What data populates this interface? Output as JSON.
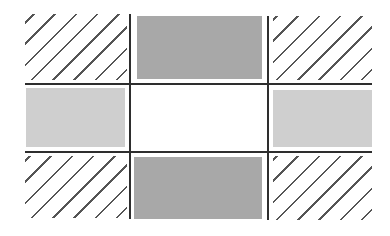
{
  "diagram": {
    "type": "3x3 grid tiling diagram",
    "colors": {
      "background": "#ffffff",
      "edge_rect": "#a8a8a8",
      "side_rect": "#cfcfcf",
      "grid_line": "#2e2e2e",
      "hatch": "#555555"
    },
    "cells": [
      {
        "row": 0,
        "col": 0,
        "fill": "hatched",
        "x": 25,
        "y": 14,
        "w": 102,
        "h": 66
      },
      {
        "row": 0,
        "col": 1,
        "fill": "dark-gray",
        "x": 137,
        "y": 16,
        "w": 125,
        "h": 63
      },
      {
        "row": 0,
        "col": 2,
        "fill": "hatched",
        "x": 273,
        "y": 16,
        "w": 99,
        "h": 64
      },
      {
        "row": 1,
        "col": 0,
        "fill": "light-gray",
        "x": 26,
        "y": 88,
        "w": 99,
        "h": 59
      },
      {
        "row": 1,
        "col": 1,
        "fill": "white",
        "x": 133,
        "y": 87,
        "w": 133,
        "h": 63
      },
      {
        "row": 1,
        "col": 2,
        "fill": "light-gray",
        "x": 273,
        "y": 90,
        "w": 99,
        "h": 57
      },
      {
        "row": 2,
        "col": 0,
        "fill": "hatched",
        "x": 25,
        "y": 156,
        "w": 102,
        "h": 62
      },
      {
        "row": 2,
        "col": 1,
        "fill": "dark-gray",
        "x": 134,
        "y": 157,
        "w": 128,
        "h": 62
      },
      {
        "row": 2,
        "col": 2,
        "fill": "hatched",
        "x": 273,
        "y": 156,
        "w": 99,
        "h": 64
      }
    ],
    "lines": {
      "vertical": [
        {
          "x": 130,
          "y1": 14,
          "y2": 218
        },
        {
          "x": 268,
          "y1": 16,
          "y2": 220
        }
      ],
      "horizontal": [
        {
          "y": 83,
          "x1": 25,
          "x2": 372
        },
        {
          "y": 151,
          "x1": 25,
          "x2": 372
        }
      ]
    }
  }
}
